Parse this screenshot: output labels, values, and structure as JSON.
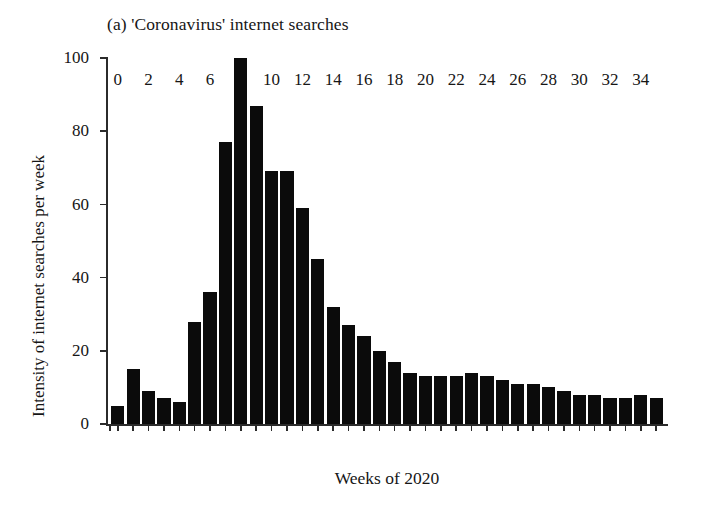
{
  "chart_data": {
    "type": "bar",
    "title": "(a) 'Coronavirus' internet searches",
    "subtitle": "",
    "xlabel": "Weeks of 2020",
    "ylabel": "Intensity of internet searches per week",
    "xlim": [
      -0.7,
      35.7
    ],
    "ylim": [
      0,
      100
    ],
    "grid": false,
    "legend": null,
    "ytick_labels": [
      "0",
      "20",
      "40",
      "60",
      "80",
      "100"
    ],
    "ytick_values": [
      0,
      20,
      40,
      60,
      80,
      100
    ],
    "xtick_labels": [
      "0",
      "2",
      "4",
      "6",
      "8",
      "10",
      "12",
      "14",
      "16",
      "18",
      "20",
      "22",
      "24",
      "26",
      "28",
      "30",
      "32",
      "34"
    ],
    "xtick_values": [
      0,
      2,
      4,
      6,
      8,
      10,
      12,
      14,
      16,
      18,
      20,
      22,
      24,
      26,
      28,
      30,
      32,
      34
    ],
    "categories": [
      0,
      1,
      2,
      3,
      4,
      5,
      6,
      7,
      8,
      9,
      10,
      11,
      12,
      13,
      14,
      15,
      16,
      17,
      18,
      19,
      20,
      21,
      22,
      23,
      24,
      25,
      26,
      27,
      28,
      29,
      30,
      31,
      32,
      33,
      34,
      35
    ],
    "values": [
      5,
      15,
      9,
      7,
      6,
      28,
      36,
      77,
      100,
      87,
      69,
      69,
      59,
      45,
      32,
      27,
      24,
      20,
      17,
      14,
      13,
      13,
      13,
      14,
      13,
      12,
      11,
      11,
      10,
      9,
      8,
      8,
      7,
      7,
      8,
      7
    ],
    "bar_color": "#0b0b0b",
    "axis_color": "#2b2b2b",
    "background": "#ffffff"
  }
}
